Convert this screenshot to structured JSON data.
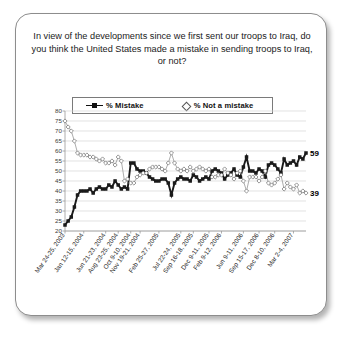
{
  "card": {
    "title": "In view of the developments since we first sent our troops to Iraq, do you think the United States made a mistake in sending troops to Iraq, or not?"
  },
  "legend": {
    "mistake_label": "% Mistake",
    "notmistake_label": "% Not a mistake",
    "mistake_icon": "line-square-marker",
    "notmistake_icon": "diamond-marker"
  },
  "chart_data": {
    "type": "line",
    "title": "In view of the developments since we first sent our troops to Iraq, do you think the United States made a mistake in sending troops to Iraq, or not?",
    "xlabel": "",
    "ylabel": "",
    "ylim": [
      20,
      80
    ],
    "yticks": [
      20,
      25,
      30,
      35,
      40,
      45,
      50,
      55,
      60,
      65,
      70,
      75,
      80
    ],
    "grid": true,
    "legend_position": "top-center",
    "xtick_labels": [
      "Mar 24-25, 2003",
      "Jan 12-15, 2004",
      "Jun 21-23, 2004",
      "Aug 23-25, 2004",
      "Oct 9-10, 2004",
      "Nov 19-21, 2004",
      "Feb 25-27, 2005",
      "Jul 22-24, 2005",
      "Sep 16-18, 2005",
      "Dec 9-11, 2005",
      "Feb 9-12, 2006",
      "Jun 9-11, 2006",
      "Sep 15-17, 2006",
      "Dec 8-10, 2006",
      "Mar 2-4, 2007"
    ],
    "xtick_indices": [
      0,
      6,
      13,
      17,
      21,
      24,
      30,
      37,
      41,
      46,
      50,
      57,
      62,
      67,
      73
    ],
    "end_labels": {
      "mistake": "59",
      "notmistake": "39"
    },
    "series": [
      {
        "name": "% Mistake",
        "color": "#1a1a1a",
        "marker": "square",
        "values": [
          23,
          25,
          27,
          32,
          38,
          40,
          40,
          40,
          41,
          39,
          41,
          42,
          41,
          41,
          43,
          42,
          45,
          43,
          41,
          42,
          41,
          54,
          54,
          51,
          50,
          50,
          49,
          47,
          46,
          45,
          45,
          46,
          46,
          44,
          38,
          44,
          46,
          47,
          46,
          46,
          45,
          48,
          47,
          45,
          46,
          47,
          46,
          50,
          51,
          50,
          49,
          46,
          48,
          49,
          51,
          48,
          47,
          52,
          57,
          50,
          50,
          49,
          51,
          50,
          47,
          53,
          54,
          53,
          51,
          49,
          56,
          53,
          54,
          55,
          53,
          57,
          56,
          59
        ]
      },
      {
        "name": "% Not a mistake",
        "color": "#9d9d9d",
        "marker": "diamond",
        "values": [
          75,
          72,
          70,
          65,
          59,
          58,
          58,
          58,
          57,
          57,
          56,
          55,
          56,
          54,
          54,
          55,
          53,
          57,
          55,
          45,
          46,
          44,
          44,
          47,
          48,
          49,
          49,
          51,
          52,
          52,
          52,
          51,
          50,
          54,
          59,
          54,
          51,
          50,
          51,
          50,
          52,
          50,
          51,
          52,
          51,
          50,
          51,
          47,
          47,
          48,
          48,
          51,
          49,
          48,
          46,
          49,
          50,
          45,
          40,
          47,
          47,
          47,
          45,
          47,
          50,
          44,
          43,
          44,
          46,
          48,
          41,
          44,
          42,
          41,
          43,
          39,
          40,
          39
        ]
      }
    ]
  }
}
